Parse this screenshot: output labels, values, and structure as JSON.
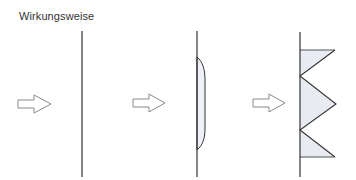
{
  "title": "Wirkungsweise",
  "colors": {
    "line": "#333333",
    "arrow_stroke": "#8a8a8a",
    "fill_light": "#eef2f8",
    "fill_zigzag": "#e8ecf2"
  },
  "panels": [
    {
      "name": "panel-1",
      "description": "force arrow against plain vertical line (no deformation)"
    },
    {
      "name": "panel-2",
      "description": "force arrow against line with smooth convex bulge"
    },
    {
      "name": "panel-3",
      "description": "force arrow against line with triangular zigzag folds"
    }
  ]
}
